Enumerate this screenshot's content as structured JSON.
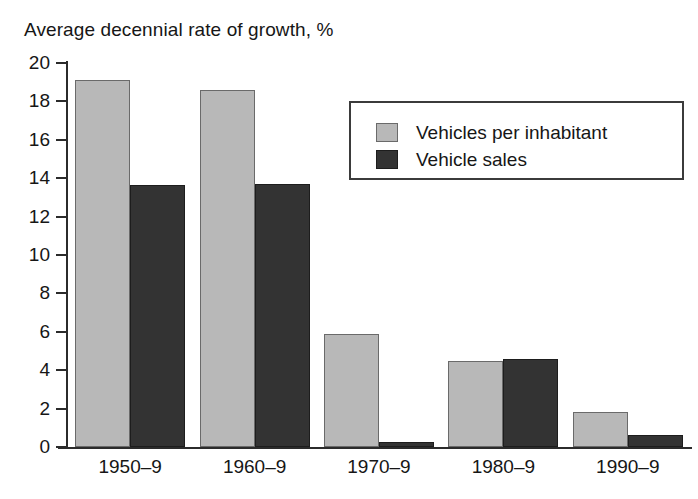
{
  "chart_data": {
    "type": "bar",
    "title": "Average decennial rate of growth, %",
    "xlabel": "",
    "ylabel": "",
    "ylim": [
      0,
      20
    ],
    "ytick_step": 2,
    "yticks": [
      0,
      2,
      4,
      6,
      8,
      10,
      12,
      14,
      16,
      18,
      20
    ],
    "ytick_labels": [
      "0",
      "2",
      "4",
      "6",
      "8",
      "10",
      "12",
      "14",
      "16",
      "18",
      "20"
    ],
    "categories": [
      "1950–9",
      "1960–9",
      "1970–9",
      "1980–9",
      "1990–9"
    ],
    "grid": false,
    "legend_position": "upper right",
    "series": [
      {
        "name": "Vehicles per inhabitant",
        "color": "#b8b8b8",
        "values": [
          19.1,
          18.6,
          5.9,
          4.5,
          1.8
        ]
      },
      {
        "name": "Vehicle sales",
        "color": "#333333",
        "values": [
          13.65,
          13.7,
          0.25,
          4.6,
          0.65
        ]
      }
    ]
  },
  "legend": {
    "items": [
      {
        "label": "Vehicles per inhabitant",
        "swatch": "series-light"
      },
      {
        "label": "Vehicle sales",
        "swatch": "series-dark"
      }
    ]
  }
}
